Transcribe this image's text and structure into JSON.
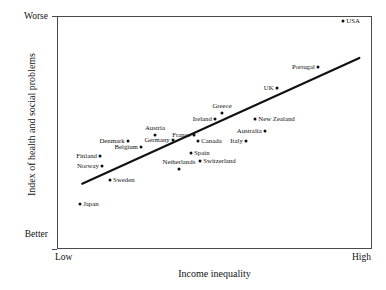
{
  "chart_data": {
    "type": "scatter",
    "title": "",
    "xlabel": "Income inequality",
    "ylabel": "Index of health and social problems",
    "x_tick_labels": [
      "Low",
      "High"
    ],
    "y_tick_labels": [
      "Worse",
      "Better"
    ],
    "y_axis_top_label": "Worse",
    "y_axis_bottom_label": "Better",
    "x_axis_left_label": "Low",
    "x_axis_right_label": "High",
    "xlim": [
      0,
      100
    ],
    "ylim": [
      0,
      100
    ],
    "grid": false,
    "legend": "none",
    "point_color": "#111111",
    "line_color": "#111111",
    "frame_color": "#4a4a4a",
    "background": "#ffffff",
    "trendline": {
      "label": "best-fit-line",
      "x": [
        8,
        96
      ],
      "y": [
        28,
        82
      ]
    },
    "points": [
      {
        "name": "USA",
        "x": 90.8,
        "y": 97.9,
        "label_side": "right"
      },
      {
        "name": "Portugal",
        "x": 82.9,
        "y": 78.1,
        "label_side": "left"
      },
      {
        "name": "UK",
        "x": 69.8,
        "y": 69.1,
        "label_side": "left"
      },
      {
        "name": "Greece",
        "x": 52.4,
        "y": 58.4,
        "label_side": "above"
      },
      {
        "name": "Ireland",
        "x": 50.2,
        "y": 55.8,
        "label_side": "left"
      },
      {
        "name": "New Zealand",
        "x": 62.9,
        "y": 55.8,
        "label_side": "right"
      },
      {
        "name": "Australia",
        "x": 66.0,
        "y": 50.6,
        "label_side": "left"
      },
      {
        "name": "France",
        "x": 43.5,
        "y": 48.9,
        "label_side": "left"
      },
      {
        "name": "Austria",
        "x": 31.1,
        "y": 48.9,
        "label_side": "above"
      },
      {
        "name": "Germany",
        "x": 36.8,
        "y": 46.8,
        "label_side": "left"
      },
      {
        "name": "Canada",
        "x": 44.8,
        "y": 46.4,
        "label_side": "right"
      },
      {
        "name": "Italy",
        "x": 60.0,
        "y": 46.4,
        "label_side": "left"
      },
      {
        "name": "Denmark",
        "x": 22.5,
        "y": 46.4,
        "label_side": "left"
      },
      {
        "name": "Belgium",
        "x": 26.7,
        "y": 43.8,
        "label_side": "left"
      },
      {
        "name": "Spain",
        "x": 42.5,
        "y": 41.2,
        "label_side": "right"
      },
      {
        "name": "Finland",
        "x": 13.7,
        "y": 39.9,
        "label_side": "left"
      },
      {
        "name": "Switzerland",
        "x": 45.4,
        "y": 37.8,
        "label_side": "right"
      },
      {
        "name": "Norway",
        "x": 14.3,
        "y": 35.6,
        "label_side": "left"
      },
      {
        "name": "Netherlands",
        "x": 38.7,
        "y": 34.3,
        "label_side": "above"
      },
      {
        "name": "Sweden",
        "x": 16.8,
        "y": 29.6,
        "label_side": "right"
      },
      {
        "name": "Japan",
        "x": 7.3,
        "y": 19.3,
        "label_side": "right"
      }
    ]
  }
}
